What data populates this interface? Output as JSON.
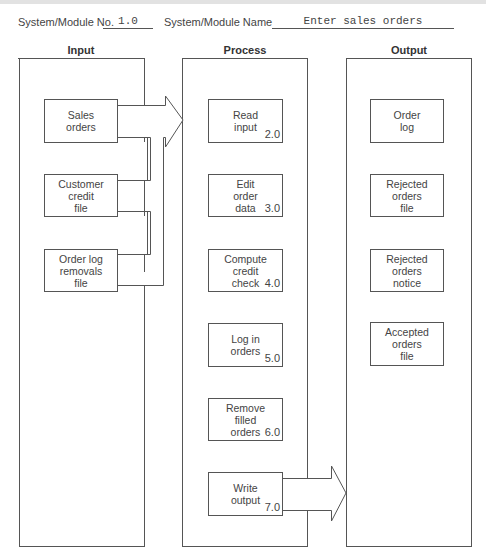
{
  "header": {
    "module_no_label": "System/Module No.",
    "module_no_value": "1.0",
    "module_name_label": "System/Module Name",
    "module_name_value": "Enter sales orders"
  },
  "columns": {
    "input": {
      "title": "Input"
    },
    "process": {
      "title": "Process"
    },
    "output": {
      "title": "Output"
    }
  },
  "inputs": [
    {
      "label": "Sales\norders"
    },
    {
      "label": "Customer\ncredit\nfile"
    },
    {
      "label": "Order log\nremovals\nfile"
    }
  ],
  "processes": [
    {
      "label": "Read\ninput",
      "number": "2.0"
    },
    {
      "label": "Edit\norder\ndata",
      "number": "3.0"
    },
    {
      "label": "Compute\ncredit\ncheck",
      "number": "4.0"
    },
    {
      "label": "Log in\norders",
      "number": "5.0"
    },
    {
      "label": "Remove\nfilled\norders",
      "number": "6.0"
    },
    {
      "label": "Write\noutput",
      "number": "7.0"
    }
  ],
  "outputs": [
    {
      "label": "Order\nlog"
    },
    {
      "label": "Rejected\norders\nfile"
    },
    {
      "label": "Rejected\norders\nnotice"
    },
    {
      "label": "Accepted\norders\nfile"
    }
  ],
  "arrows": [
    {
      "from": "input-panel",
      "to": "process-panel"
    },
    {
      "from": "write-output",
      "to": "output-panel"
    }
  ]
}
